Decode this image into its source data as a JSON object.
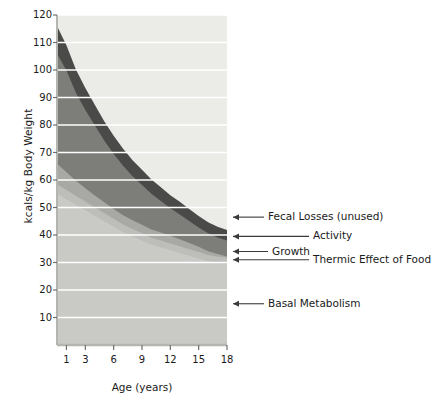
{
  "chart_data": {
    "type": "area",
    "title": "",
    "subtitle": "",
    "xlabel": "Age (years)",
    "ylabel": "kcals/kg Body Weight",
    "xlim": [
      0,
      18
    ],
    "ylim": [
      0,
      120
    ],
    "xticks": [
      1,
      3,
      6,
      9,
      12,
      15,
      18
    ],
    "yticks": [
      10,
      20,
      30,
      40,
      50,
      60,
      70,
      80,
      90,
      100,
      110,
      120
    ],
    "grid": "horizontal",
    "legend_position": "right-callouts",
    "stacked": true,
    "x": [
      0,
      1,
      2,
      3,
      4,
      5,
      6,
      7,
      8,
      9,
      10,
      11,
      12,
      13,
      14,
      15,
      16,
      17,
      18
    ],
    "series": [
      {
        "name": "Basal Metabolism",
        "color": "#c9c9c6",
        "values": [
          55,
          53,
          51,
          49,
          47,
          45,
          43,
          41,
          39.5,
          38,
          36.5,
          35.5,
          34.5,
          33.5,
          32.5,
          31.5,
          30.5,
          30,
          29.5
        ]
      },
      {
        "name": "Thermic Effect of Food",
        "color": "#bdbdba",
        "values": [
          3.5,
          3.4,
          3.3,
          3.2,
          3.1,
          3.0,
          2.9,
          2.8,
          2.7,
          2.6,
          2.5,
          2.5,
          2.4,
          2.4,
          2.3,
          2.3,
          2.2,
          2.2,
          2.2
        ]
      },
      {
        "name": "Growth",
        "color": "#a8a8a5",
        "values": [
          7.5,
          6.4,
          5.4,
          4.8,
          4.3,
          3.9,
          3.6,
          3.4,
          3.2,
          3.1,
          3.0,
          2.9,
          2.8,
          2.6,
          2.3,
          1.9,
          1.4,
          0.9,
          0.5
        ]
      },
      {
        "name": "Activity",
        "color": "#7d7d7a",
        "values": [
          40,
          37,
          32,
          28.5,
          25.5,
          22.5,
          20,
          18,
          16,
          14.5,
          13,
          11.5,
          10,
          9,
          8,
          7,
          6.5,
          6,
          5.8
        ]
      },
      {
        "name": "Fecal Losses (unused)",
        "color": "#4a4a48",
        "values": [
          10,
          9.2,
          8.5,
          8.0,
          7.5,
          7.0,
          6.6,
          6.2,
          5.8,
          5.5,
          5.2,
          5.0,
          4.8,
          4.6,
          4.4,
          4.2,
          4.0,
          3.9,
          3.8
        ]
      }
    ],
    "plot_background": "#ebebe8",
    "annotations": [
      {
        "label": "Fecal Losses (unused)",
        "arrow_y_value": 46.5,
        "text_x_px": 268
      },
      {
        "label": "Activity",
        "arrow_y_value": 39.5,
        "text_x_px": 313
      },
      {
        "label": "Growth",
        "arrow_y_value": 34.0,
        "text_x_px": 272
      },
      {
        "label": "Thermic Effect of Food",
        "arrow_y_value": 31.0,
        "text_x_px": 313
      },
      {
        "label": "Basal Metabolism",
        "arrow_y_value": 15.0,
        "text_x_px": 268
      }
    ]
  }
}
